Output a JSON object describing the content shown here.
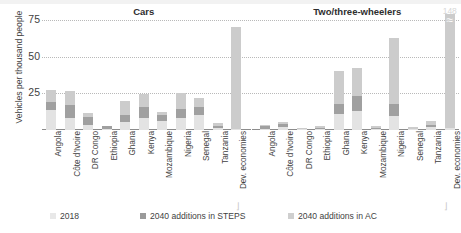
{
  "chart_data": {
    "type": "bar",
    "title": "",
    "ylabel": "Vehicles per thousand people",
    "xlabel": "",
    "ylim": [
      0,
      75
    ],
    "yticks": [
      25,
      50,
      75
    ],
    "grid": true,
    "stacked": true,
    "legend_position": "bottom",
    "legend": [
      {
        "name": "2018",
        "color": "#e3e3e3"
      },
      {
        "name": "2040 additions in STEPS",
        "color": "#a0a0a0"
      },
      {
        "name": "2040 additions in AC",
        "color": "#cccccc"
      }
    ],
    "panels": [
      {
        "title": "Cars",
        "categories": [
          "Angola",
          "Côte d'Ivoire",
          "DR Congo",
          "Ethiopia",
          "Ghana",
          "Kenya",
          "Mozambique",
          "Nigeria",
          "Senegal",
          "Tanzania",
          "Dev. economies"
        ],
        "series": [
          {
            "name": "2018",
            "values": [
              13.5,
              8.0,
              3.5,
              1.0,
              5.5,
              8.0,
              6.0,
              8.0,
              10.0,
              1.5,
              1.0
            ]
          },
          {
            "name": "2040 additions in STEPS",
            "values": [
              5.5,
              9.0,
              5.5,
              1.5,
              5.0,
              8.0,
              4.5,
              6.0,
              6.0,
              1.5,
              0.0
            ]
          },
          {
            "name": "2040 additions in AC",
            "values": [
              8.5,
              9.5,
              2.5,
              0.5,
              9.5,
              8.5,
              1.5,
              11.5,
              6.0,
              1.5,
              69.0
            ]
          }
        ],
        "labels": []
      },
      {
        "title": "Two/three-wheelers",
        "categories": [
          "Angola",
          "Côte d'Ivoire",
          "DR Congo",
          "Ethiopia",
          "Ghana",
          "Kenya",
          "Mozambique",
          "Nigeria",
          "Senegal",
          "Tanzania",
          "Dev. economies"
        ],
        "series": [
          {
            "name": "2018",
            "values": [
              1.0,
              2.0,
              0.5,
              0.5,
              11.0,
              13.0,
              0.5,
              9.5,
              0.5,
              2.0,
              2.0
            ]
          },
          {
            "name": "2040 additions in STEPS",
            "values": [
              1.5,
              2.0,
              0.5,
              1.0,
              7.0,
              10.0,
              1.0,
              8.5,
              0.5,
              1.5,
              0.0
            ]
          },
          {
            "name": "2040 additions in AC",
            "values": [
              1.0,
              1.5,
              0.5,
              1.0,
              22.5,
              19.0,
              1.0,
              45.0,
              1.0,
              2.5,
              146.0
            ]
          }
        ],
        "labels": [
          {
            "category": "Dev. economies",
            "text": "148",
            "clipped": true
          }
        ]
      }
    ]
  },
  "legend": {
    "items": [
      {
        "label": "2018",
        "swatch": "sw-2018"
      },
      {
        "label": "2040 additions in STEPS",
        "swatch": "sw-steps"
      },
      {
        "label": "2040 additions in AC",
        "swatch": "sw-ac"
      }
    ]
  },
  "axis": {
    "y_title": "Vehicles per thousand people",
    "y_ticks": [
      "75",
      "50",
      "25"
    ]
  }
}
